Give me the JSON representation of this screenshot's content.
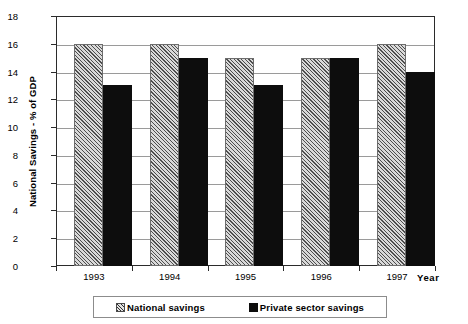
{
  "chart_data": {
    "type": "bar",
    "title": "",
    "xlabel": "Year",
    "ylabel": "National Savings - % of GDP",
    "categories": [
      "1993",
      "1994",
      "1995",
      "1996",
      "1997"
    ],
    "series": [
      {
        "name": "National savings",
        "values": [
          16,
          16,
          15,
          15,
          16
        ]
      },
      {
        "name": "Private sector savings",
        "values": [
          13,
          15,
          13,
          15,
          14
        ]
      }
    ],
    "ylim": [
      0,
      18
    ],
    "ytick_step": 2,
    "yticks": [
      0,
      2,
      4,
      6,
      8,
      10,
      12,
      14,
      16,
      18
    ],
    "grid": "horizontal",
    "legend_position": "bottom"
  },
  "axes": {
    "y_title": "National Savings - % of GDP",
    "x_title": "Year",
    "y_tick_labels": [
      "18",
      "16",
      "14",
      "12",
      "10",
      "8",
      "6",
      "4",
      "2",
      "0"
    ],
    "x_tick_labels": [
      "1993",
      "1994",
      "1995",
      "1996",
      "1997"
    ]
  },
  "legend": {
    "items": [
      {
        "label": "National savings",
        "icon": "hatched-square-swatch",
        "color": "#d9d9d9"
      },
      {
        "label": "Private sector savings",
        "icon": "filled-square-swatch",
        "color": "#0d0d0d"
      }
    ]
  },
  "colors": {
    "national_savings_fill": "#d9d9d9",
    "private_savings_fill": "#0d0d0d",
    "gridline": "#9a9a9a",
    "frame": "#2b2b2b",
    "background": "#ffffff"
  }
}
